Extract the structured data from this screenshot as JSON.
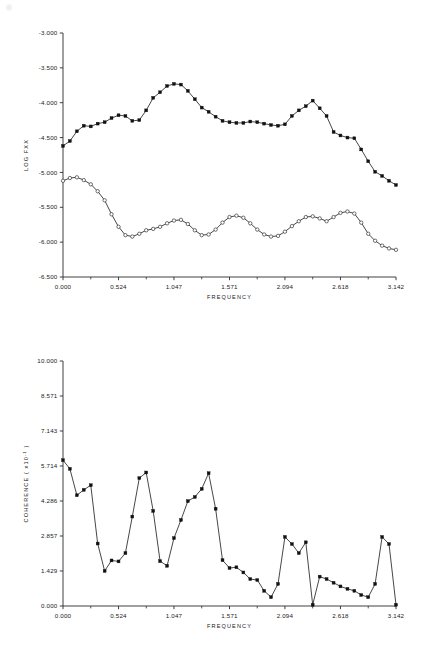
{
  "figure": {
    "background": "#ffffff",
    "ink_color": "#1a1a1a"
  },
  "chart_data": [
    {
      "id": "log-fxx-panel",
      "type": "line",
      "title": "",
      "xlabel": "FREQUENCY",
      "ylabel": "LOG FXX",
      "xlim": [
        0.0,
        3.142
      ],
      "ylim": [
        -6.5,
        -3.0
      ],
      "grid": false,
      "legend": "none",
      "xticks": [
        "0.000",
        "0.524",
        "1.047",
        "1.571",
        "2.094",
        "2.618",
        "3.142"
      ],
      "xtick_values": [
        0.0,
        0.524,
        1.047,
        1.571,
        2.094,
        2.618,
        3.142
      ],
      "yticks": [
        "-3.000",
        "-3.500",
        "-4.000",
        "-4.500",
        "-5.000",
        "-5.500",
        "-6.000",
        "-6.500"
      ],
      "ytick_values": [
        -3.0,
        -3.5,
        -4.0,
        -4.5,
        -5.0,
        -5.5,
        -6.0,
        -6.5
      ],
      "x": [
        0.0,
        0.065,
        0.131,
        0.196,
        0.262,
        0.327,
        0.393,
        0.458,
        0.524,
        0.589,
        0.654,
        0.72,
        0.785,
        0.851,
        0.916,
        0.982,
        1.047,
        1.113,
        1.178,
        1.244,
        1.309,
        1.374,
        1.44,
        1.505,
        1.571,
        1.636,
        1.702,
        1.767,
        1.833,
        1.898,
        1.963,
        2.029,
        2.094,
        2.16,
        2.225,
        2.291,
        2.356,
        2.422,
        2.487,
        2.553,
        2.618,
        2.684,
        2.749,
        2.814,
        2.88,
        2.945,
        3.011,
        3.076,
        3.142
      ],
      "series": [
        {
          "name": "upper-spectrum",
          "marker": "filled-square",
          "values": [
            -4.62,
            -4.55,
            -4.41,
            -4.33,
            -4.34,
            -4.3,
            -4.28,
            -4.22,
            -4.18,
            -4.19,
            -4.26,
            -4.25,
            -4.11,
            -3.93,
            -3.85,
            -3.76,
            -3.73,
            -3.74,
            -3.83,
            -3.95,
            -4.07,
            -4.13,
            -4.2,
            -4.26,
            -4.28,
            -4.29,
            -4.29,
            -4.27,
            -4.28,
            -4.3,
            -4.32,
            -4.33,
            -4.31,
            -4.19,
            -4.11,
            -4.05,
            -3.97,
            -4.08,
            -4.19,
            -4.42,
            -4.47,
            -4.5,
            -4.51,
            -4.67,
            -4.84,
            -4.99,
            -5.05,
            -5.12,
            -5.18
          ]
        },
        {
          "name": "lower-spectrum",
          "marker": "open-circle",
          "values": [
            -5.12,
            -5.08,
            -5.07,
            -5.11,
            -5.17,
            -5.27,
            -5.4,
            -5.6,
            -5.78,
            -5.9,
            -5.92,
            -5.88,
            -5.83,
            -5.81,
            -5.78,
            -5.73,
            -5.69,
            -5.68,
            -5.74,
            -5.83,
            -5.9,
            -5.89,
            -5.82,
            -5.72,
            -5.64,
            -5.62,
            -5.65,
            -5.73,
            -5.82,
            -5.89,
            -5.92,
            -5.91,
            -5.85,
            -5.77,
            -5.7,
            -5.64,
            -5.63,
            -5.66,
            -5.7,
            -5.64,
            -5.58,
            -5.56,
            -5.59,
            -5.72,
            -5.88,
            -5.98,
            -6.05,
            -6.09,
            -6.11
          ]
        }
      ]
    },
    {
      "id": "coherence-panel",
      "type": "line",
      "title": "",
      "xlabel": "FREQUENCY",
      "ylabel": "COHERENCE  ( x10",
      "ylabel_exponent": "-1",
      "ylabel_suffix": " )",
      "xlim": [
        0.0,
        3.142
      ],
      "ylim": [
        0.0,
        10.0
      ],
      "grid": false,
      "legend": "none",
      "xticks": [
        "0.000",
        "0.524",
        "1.047",
        "1.571",
        "2.094",
        "2.618",
        "3.142"
      ],
      "xtick_values": [
        0.0,
        0.524,
        1.047,
        1.571,
        2.094,
        2.618,
        3.142
      ],
      "yticks": [
        "10.000",
        "8.571",
        "7.143",
        "5.714",
        "4.286",
        "2.857",
        "1.429",
        "0.000"
      ],
      "ytick_values": [
        10.0,
        8.571,
        7.143,
        5.714,
        4.286,
        2.857,
        1.429,
        0.0
      ],
      "x": [
        0.0,
        0.065,
        0.131,
        0.196,
        0.262,
        0.327,
        0.393,
        0.458,
        0.524,
        0.589,
        0.654,
        0.72,
        0.785,
        0.851,
        0.916,
        0.982,
        1.047,
        1.113,
        1.178,
        1.244,
        1.309,
        1.374,
        1.44,
        1.505,
        1.571,
        1.636,
        1.702,
        1.767,
        1.833,
        1.898,
        1.963,
        2.029,
        2.094,
        2.16,
        2.225,
        2.291,
        2.356,
        2.422,
        2.487,
        2.553,
        2.618,
        2.684,
        2.749,
        2.814,
        2.88,
        2.945,
        3.011,
        3.076,
        3.142
      ],
      "series": [
        {
          "name": "coherence",
          "marker": "filled-square",
          "values": [
            5.95,
            5.6,
            4.52,
            4.74,
            4.93,
            2.55,
            1.43,
            1.86,
            1.82,
            2.16,
            3.65,
            5.22,
            5.45,
            3.88,
            1.83,
            1.64,
            2.77,
            3.51,
            4.28,
            4.45,
            4.78,
            5.42,
            3.97,
            1.87,
            1.55,
            1.58,
            1.37,
            1.1,
            1.06,
            0.62,
            0.36,
            0.9,
            2.82,
            2.53,
            2.16,
            2.6,
            0.05,
            2.82,
            2.53,
            2.16,
            2.6,
            0.05,
            0.0,
            0.0,
            0.0,
            0.0,
            0.0,
            0.0,
            0.0
          ]
        }
      ],
      "series_actual": [
        {
          "name": "coherence",
          "marker": "filled-square",
          "x": [
            0.0,
            0.065,
            0.131,
            0.196,
            0.262,
            0.327,
            0.393,
            0.458,
            0.524,
            0.589,
            0.654,
            0.72,
            0.785,
            0.851,
            0.916,
            0.982,
            1.047,
            1.113,
            1.178,
            1.244,
            1.309,
            1.374,
            1.44,
            1.505,
            1.571,
            1.636,
            1.702,
            1.767,
            1.833,
            1.898,
            1.963,
            2.029,
            2.094,
            2.16,
            2.225,
            2.291,
            2.356,
            2.422,
            2.487,
            2.553,
            2.618,
            2.684,
            2.749,
            2.814,
            2.88,
            2.945,
            3.011,
            3.076,
            3.142
          ],
          "values": [
            5.95,
            5.6,
            4.52,
            4.74,
            4.93,
            2.55,
            1.43,
            1.86,
            1.82,
            2.16,
            3.65,
            5.22,
            5.45,
            3.88,
            1.83,
            1.64,
            2.77,
            3.51,
            4.28,
            4.45,
            4.78,
            5.42,
            3.97,
            1.87,
            1.55,
            1.58,
            1.37,
            1.1,
            1.06,
            0.62,
            0.36,
            0.9,
            2.82,
            2.53,
            2.16,
            2.6,
            0.05,
            1.2,
            1.1,
            0.95,
            0.8,
            0.7,
            0.62,
            0.45,
            0.36,
            0.9,
            2.82,
            2.53,
            0.05
          ]
        }
      ]
    }
  ]
}
